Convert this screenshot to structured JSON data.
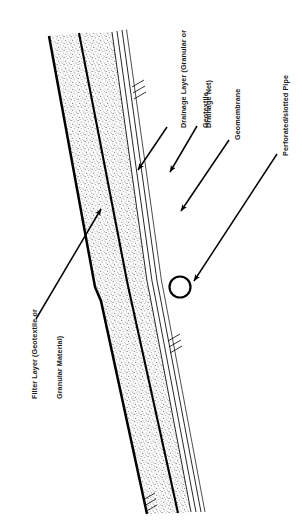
{
  "figure": {
    "type": "engineering-cross-section-diagram",
    "orientation": "labels rotated 90 degrees counter-clockwise",
    "background_color": "#ffffff",
    "ink_color": "#000000",
    "fill_pattern": "stipple"
  },
  "labels": {
    "drainage_layer": {
      "line1": "Drainage Layer (Granular or",
      "line2": "Drainage Net)"
    },
    "geotextile": "Geotextile",
    "geomembrane": "Geomembrane",
    "perforated_pipe": "Perforated/slotted Pipe",
    "filter_layer": {
      "line1": "Filter Layer (Geotextile or",
      "line2": "Granular Material)"
    }
  },
  "annotations": {
    "leaders": [
      {
        "name": "drainage-layer-leader",
        "target_label": "Drainage Layer (Granular or Drainage Net)",
        "arrow": "down-left"
      },
      {
        "name": "geotextile-leader",
        "target_label": "Geotextile",
        "arrow": "down-left"
      },
      {
        "name": "geomembrane-leader",
        "target_label": "Geomembrane",
        "arrow": "down-left"
      },
      {
        "name": "perforated-pipe-leader",
        "target_label": "Perforated/slotted Pipe",
        "arrow": "down-left"
      },
      {
        "name": "filter-layer-leader",
        "target_label": "Filter Layer (Geotextile or Granular Material)",
        "arrow": "up-right"
      }
    ]
  },
  "components": {
    "pipe": {
      "shape": "circle",
      "name": "perforated-slotted-pipe"
    },
    "liner_lines": 3,
    "hatch_groups": 3
  }
}
